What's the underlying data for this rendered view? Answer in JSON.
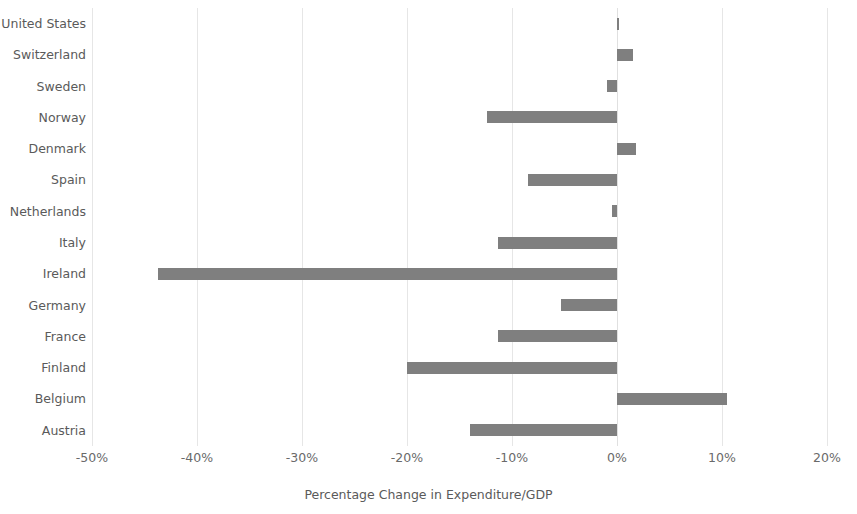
{
  "chart_data": {
    "type": "bar",
    "orientation": "horizontal",
    "title": "",
    "subtitle": "",
    "xlabel": "Percentage Change in Expenditure/GDP",
    "ylabel": "",
    "xlim": [
      -50,
      20
    ],
    "ylim": null,
    "xticks": [
      "-50%",
      "-40%",
      "-30%",
      "-20%",
      "-10%",
      "0%",
      "10%",
      "20%"
    ],
    "xtick_values": [
      -50,
      -40,
      -30,
      -20,
      -10,
      0,
      10,
      20
    ],
    "grid": "vertical",
    "legend": null,
    "legend_position": "none",
    "bar_color": "#7f7f7f",
    "grid_color": "#e6e6e6",
    "text_color": "#5a5a5a",
    "background": "#ffffff",
    "categories": [
      "United States",
      "Switzerland",
      "Sweden",
      "Norway",
      "Denmark",
      "Spain",
      "Netherlands",
      "Italy",
      "Ireland",
      "Germany",
      "France",
      "Finland",
      "Belgium",
      "Austria"
    ],
    "values": [
      0.2,
      1.5,
      -1.0,
      -12.4,
      1.8,
      -8.5,
      -0.5,
      -11.3,
      -43.7,
      -5.3,
      -11.3,
      -20.0,
      10.5,
      -14.0
    ]
  }
}
